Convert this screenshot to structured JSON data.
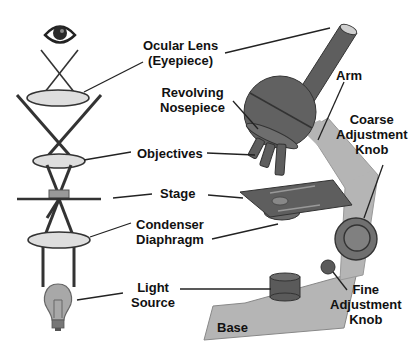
{
  "diagram": {
    "colors": {
      "dark_part": "#5a5a5a",
      "mid_part": "#808080",
      "light_part": "#b5b5b5",
      "lens_fill": "#dedede",
      "line": "#222222"
    },
    "labels": {
      "ocular": [
        "Ocular Lens",
        "(Eyepiece)"
      ],
      "nosepiece": [
        "Revolving",
        "Nosepiece"
      ],
      "arm": [
        "Arm"
      ],
      "coarse": [
        "Coarse",
        "Adjustment",
        "Knob"
      ],
      "objectives": [
        "Objectives"
      ],
      "stage": [
        "Stage"
      ],
      "condenser": [
        "Condenser",
        "Diaphragm"
      ],
      "light": [
        "Light",
        "Source"
      ],
      "fine": [
        "Fine",
        "Adjustment",
        "Knob"
      ],
      "base": [
        "Base"
      ]
    },
    "icons": {
      "eye": "eye-icon",
      "bulb": "light-bulb-icon"
    }
  }
}
